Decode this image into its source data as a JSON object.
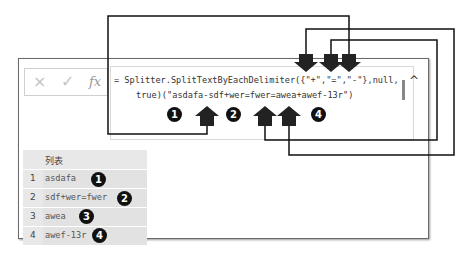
{
  "formula_bar": {
    "cancel_icon": "×",
    "confirm_icon": "✓",
    "fx_label": "fx",
    "line1": "= Splitter.SplitTextByEachDelimiter({\"+\",\"=\",\"-\"},null,",
    "line2": "true)(\"asdafa-sdf+wer=fwer=awea+awef-13r\")",
    "scroll_up_icon": "^"
  },
  "annotations": {
    "formula_badges": [
      "1",
      "2",
      "4"
    ]
  },
  "table": {
    "header": "列表",
    "rows": [
      {
        "index": "1",
        "value": "asdafa",
        "badge": "1"
      },
      {
        "index": "2",
        "value": "sdf+wer=fwer",
        "badge": "2"
      },
      {
        "index": "3",
        "value": "awea",
        "badge": "3"
      },
      {
        "index": "4",
        "value": "awef-13r",
        "badge": "4"
      }
    ]
  }
}
